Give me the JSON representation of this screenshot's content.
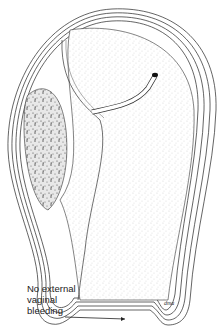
{
  "figure": {
    "annotation": {
      "line1": "No external",
      "line2": "vaginal",
      "line3": "bleeding"
    },
    "signature": "dma"
  }
}
